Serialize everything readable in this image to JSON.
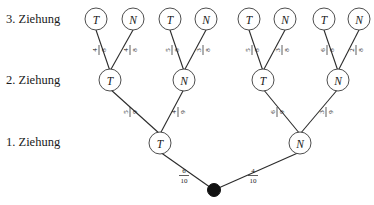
{
  "diagram": {
    "type": "probability-tree",
    "title": "",
    "language": "de",
    "stage_labels": [
      {
        "id": "stage-3",
        "text": "3. Ziehung"
      },
      {
        "id": "stage-2",
        "text": "2. Ziehung"
      },
      {
        "id": "stage-1",
        "text": "1. Ziehung"
      }
    ],
    "root": {
      "label": "",
      "symbol": "filled-dot"
    },
    "level1_nodes": [
      {
        "label": "T"
      },
      {
        "label": "N"
      }
    ],
    "level1_probabilities": [
      {
        "numerator": "6",
        "denominator": "10"
      },
      {
        "numerator": "4",
        "denominator": "10"
      }
    ],
    "level2_nodes": [
      {
        "label": "T"
      },
      {
        "label": "N"
      },
      {
        "label": "T"
      },
      {
        "label": "N"
      }
    ],
    "level2_probabilities": [
      {
        "numerator": "5",
        "denominator": "9"
      },
      {
        "numerator": "4",
        "denominator": "9"
      },
      {
        "numerator": "6",
        "denominator": "9"
      },
      {
        "numerator": "3",
        "denominator": "9"
      }
    ],
    "level3_nodes": [
      {
        "label": "T"
      },
      {
        "label": "N"
      },
      {
        "label": "T"
      },
      {
        "label": "N"
      },
      {
        "label": "T"
      },
      {
        "label": "N"
      },
      {
        "label": "T"
      },
      {
        "label": "N"
      }
    ],
    "level3_probabilities": [
      {
        "numerator": "4",
        "denominator": "8"
      },
      {
        "numerator": "4",
        "denominator": "8"
      },
      {
        "numerator": "5",
        "denominator": "8"
      },
      {
        "numerator": "3",
        "denominator": "8"
      },
      {
        "numerator": "5",
        "denominator": "8"
      },
      {
        "numerator": "3",
        "denominator": "8"
      },
      {
        "numerator": "6",
        "denominator": "8"
      },
      {
        "numerator": "2",
        "denominator": "8"
      }
    ],
    "colors": {
      "line": "#2b2b2b",
      "node_stroke": "#3a3a3a",
      "node_fill": "#ffffff",
      "text": "#1a1a1a",
      "root_dot": "#111111",
      "background": "#ffffff"
    }
  }
}
